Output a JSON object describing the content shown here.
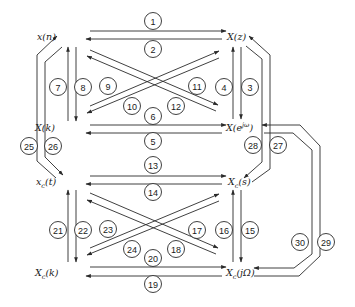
{
  "diagram": {
    "type": "transform-relationship-diagram",
    "background": "#ffffff",
    "line_color": "#2a2a2a",
    "nodes": [
      {
        "id": "xn",
        "label": "x(n)",
        "x": 45,
        "y": 40
      },
      {
        "id": "Xz",
        "label": "X(z)",
        "x": 238,
        "y": 40
      },
      {
        "id": "Xk",
        "label": "X(k)",
        "x": 45,
        "y": 131
      },
      {
        "id": "Xejw",
        "label": "X(e^jω)",
        "x": 243,
        "y": 131
      },
      {
        "id": "xct",
        "label": "x_c(t)",
        "x": 45,
        "y": 185
      },
      {
        "id": "Xcs",
        "label": "X_c(s)",
        "x": 240,
        "y": 185
      },
      {
        "id": "Xck",
        "label": "X_c(k)",
        "x": 45,
        "y": 274
      },
      {
        "id": "XcjW",
        "label": "X_c(jΩ)",
        "x": 245,
        "y": 274
      }
    ],
    "node_display": {
      "xn": {
        "base": "x(n)",
        "sub": "",
        "sup": "",
        "tail": ""
      },
      "Xz": {
        "base": "X(z)",
        "sub": "",
        "sup": "",
        "tail": ""
      },
      "Xk": {
        "base": "X(k)",
        "sub": "",
        "sup": "",
        "tail": ""
      },
      "Xejw": {
        "base": "X(e",
        "sub": "",
        "sup": "jω",
        "tail": ")"
      },
      "xct": {
        "base": "x",
        "sub": "c",
        "sup": "",
        "tail": "(t)"
      },
      "Xcs": {
        "base": "X",
        "sub": "c",
        "sup": "",
        "tail": "(s)"
      },
      "Xck": {
        "base": "X",
        "sub": "c",
        "sup": "",
        "tail": "(k)"
      },
      "XcjW": {
        "base": "X",
        "sub": "c",
        "sup": "",
        "tail": "(jΩ)"
      }
    },
    "edges": [
      {
        "num": "1",
        "from": "xn",
        "to": "Xz"
      },
      {
        "num": "2",
        "from": "Xz",
        "to": "xn"
      },
      {
        "num": "3",
        "from": "Xz",
        "to": "Xejw"
      },
      {
        "num": "4",
        "from": "Xejw",
        "to": "Xz"
      },
      {
        "num": "5",
        "from": "Xejw",
        "to": "Xk"
      },
      {
        "num": "6",
        "from": "Xk",
        "to": "Xejw"
      },
      {
        "num": "7",
        "from": "Xk",
        "to": "xn"
      },
      {
        "num": "8",
        "from": "xn",
        "to": "Xk"
      },
      {
        "num": "9",
        "from": "Xk",
        "to": "Xz"
      },
      {
        "num": "10",
        "from": "Xz",
        "to": "Xk"
      },
      {
        "num": "11",
        "from": "Xejw",
        "to": "xn"
      },
      {
        "num": "12",
        "from": "xn",
        "to": "Xejw"
      },
      {
        "num": "13",
        "from": "xct",
        "to": "Xcs"
      },
      {
        "num": "14",
        "from": "Xcs",
        "to": "xct"
      },
      {
        "num": "15",
        "from": "Xcs",
        "to": "XcjW"
      },
      {
        "num": "16",
        "from": "XcjW",
        "to": "Xcs"
      },
      {
        "num": "17",
        "from": "XcjW",
        "to": "xct"
      },
      {
        "num": "18",
        "from": "xct",
        "to": "XcjW"
      },
      {
        "num": "19",
        "from": "XcjW",
        "to": "Xck"
      },
      {
        "num": "20",
        "from": "Xck",
        "to": "XcjW"
      },
      {
        "num": "21",
        "from": "Xck",
        "to": "xct"
      },
      {
        "num": "22",
        "from": "xct",
        "to": "Xck"
      },
      {
        "num": "23",
        "from": "Xck",
        "to": "Xcs"
      },
      {
        "num": "24",
        "from": "Xcs",
        "to": "Xck"
      },
      {
        "num": "25",
        "from": "xct",
        "to": "xn"
      },
      {
        "num": "26",
        "from": "xn",
        "to": "xct"
      },
      {
        "num": "27",
        "from": "XcjW",
        "to": "Xz"
      },
      {
        "num": "28",
        "from": "Xz",
        "to": "Xcs"
      },
      {
        "num": "29",
        "from": "XcjW",
        "to": "Xejw"
      },
      {
        "num": "30",
        "from": "Xejw",
        "to": "XcjW"
      }
    ],
    "edge_labels": [
      {
        "num": "1",
        "cx": 153,
        "cy": 21
      },
      {
        "num": "2",
        "cx": 153,
        "cy": 49
      },
      {
        "num": "3",
        "cx": 250,
        "cy": 87
      },
      {
        "num": "4",
        "cx": 224,
        "cy": 87
      },
      {
        "num": "5",
        "cx": 153,
        "cy": 141
      },
      {
        "num": "6",
        "cx": 153,
        "cy": 116
      },
      {
        "num": "7",
        "cx": 58,
        "cy": 87
      },
      {
        "num": "8",
        "cx": 83,
        "cy": 87
      },
      {
        "num": "9",
        "cx": 108,
        "cy": 86
      },
      {
        "num": "10",
        "cx": 132,
        "cy": 106
      },
      {
        "num": "11",
        "cx": 197,
        "cy": 86
      },
      {
        "num": "12",
        "cx": 176,
        "cy": 106
      },
      {
        "num": "13",
        "cx": 153,
        "cy": 165
      },
      {
        "num": "14",
        "cx": 153,
        "cy": 192
      },
      {
        "num": "15",
        "cx": 250,
        "cy": 230
      },
      {
        "num": "16",
        "cx": 224,
        "cy": 230
      },
      {
        "num": "17",
        "cx": 197,
        "cy": 230
      },
      {
        "num": "18",
        "cx": 176,
        "cy": 249
      },
      {
        "num": "19",
        "cx": 153,
        "cy": 284
      },
      {
        "num": "20",
        "cx": 153,
        "cy": 258
      },
      {
        "num": "21",
        "cx": 58,
        "cy": 230
      },
      {
        "num": "22",
        "cx": 83,
        "cy": 230
      },
      {
        "num": "23",
        "cx": 108,
        "cy": 229
      },
      {
        "num": "24",
        "cx": 132,
        "cy": 249
      },
      {
        "num": "25",
        "cx": 29,
        "cy": 146
      },
      {
        "num": "26",
        "cx": 53,
        "cy": 146
      },
      {
        "num": "27",
        "cx": 278,
        "cy": 145
      },
      {
        "num": "28",
        "cx": 253,
        "cy": 145
      },
      {
        "num": "29",
        "cx": 326,
        "cy": 242
      },
      {
        "num": "30",
        "cx": 300,
        "cy": 242
      }
    ],
    "paths": [
      {
        "num": "1",
        "d": "M90,31 L225,31",
        "arrow_end": true
      },
      {
        "num": "2",
        "d": "M222,39 L87,39",
        "arrow_end": true
      },
      {
        "num": "3",
        "d": "M241,47 L241,119",
        "arrow_end": true
      },
      {
        "num": "4",
        "d": "M232,119 L232,47",
        "arrow_end": true
      },
      {
        "num": "5",
        "d": "M222,133 L87,133",
        "arrow_end": true
      },
      {
        "num": "6",
        "d": "M90,125 L225,125",
        "arrow_end": true
      },
      {
        "num": "7",
        "d": "M68,121 L68,47",
        "arrow_end": true
      },
      {
        "num": "8",
        "d": "M77,47 L77,121",
        "arrow_end": true
      },
      {
        "num": "9",
        "d": "M90,106 L220,51",
        "arrow_end": true
      },
      {
        "num": "10",
        "d": "M219,59 L87,113",
        "arrow_end": true
      },
      {
        "num": "11",
        "d": "M216,113 L87,57",
        "arrow_end": true
      },
      {
        "num": "12",
        "d": "M90,51 L220,105",
        "arrow_end": true
      },
      {
        "num": "13",
        "d": "M90,175 L225,175",
        "arrow_end": true
      },
      {
        "num": "14",
        "d": "M222,183 L87,183",
        "arrow_end": true
      },
      {
        "num": "15",
        "d": "M241,190 L241,262",
        "arrow_end": true
      },
      {
        "num": "16",
        "d": "M232,262 L232,190",
        "arrow_end": true
      },
      {
        "num": "17",
        "d": "M216,256 L87,201",
        "arrow_end": true
      },
      {
        "num": "18",
        "d": "M90,194 L220,248",
        "arrow_end": true
      },
      {
        "num": "19",
        "d": "M222,276 L87,276",
        "arrow_end": true
      },
      {
        "num": "20",
        "d": "M90,268 L225,268",
        "arrow_end": true
      },
      {
        "num": "21",
        "d": "M68,262 L68,190",
        "arrow_end": true
      },
      {
        "num": "22",
        "d": "M77,190 L77,262",
        "arrow_end": true
      },
      {
        "num": "23",
        "d": "M90,248 L220,194",
        "arrow_end": true
      },
      {
        "num": "24",
        "d": "M219,201 L87,256",
        "arrow_end": true
      },
      {
        "num": "25",
        "d": "M56,179 L38,163 L38,55 L58,35",
        "arrow_end": true
      },
      {
        "num": "26",
        "d": "M62,47 L46,62 L46,160 L62,177",
        "arrow_end": true
      },
      {
        "num": "27",
        "d": "M335,265 L335,152 L296,124 L96,124 L96,124",
        "arrow_end": false
      },
      {
        "num": "28",
        "d": "M247,48 L266,62 L266,173 L251,186",
        "arrow_end": true
      }
    ]
  }
}
